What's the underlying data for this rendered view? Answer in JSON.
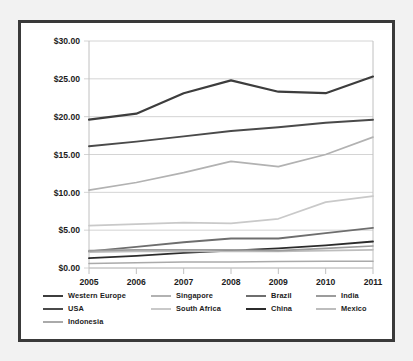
{
  "chart_data": {
    "type": "line",
    "title": "",
    "xlabel": "",
    "ylabel": "",
    "categories": [
      "2005",
      "2006",
      "2007",
      "2008",
      "2009",
      "2010",
      "2011"
    ],
    "x": [
      2005,
      2006,
      2007,
      2008,
      2009,
      2010,
      2011
    ],
    "ylim": [
      0,
      30
    ],
    "yticks": [
      0,
      5,
      10,
      15,
      20,
      25,
      30
    ],
    "ytick_labels": [
      "$0.00",
      "$5.00",
      "$10.00",
      "$15.00",
      "$20.00",
      "$25.00",
      "$30.00"
    ],
    "grid": true,
    "legend_position": "bottom",
    "series": [
      {
        "name": "Western Europe",
        "color": "#3d3d3d",
        "width": 2.2,
        "values": [
          19.6,
          20.4,
          23.1,
          24.8,
          23.3,
          23.1,
          25.3
        ]
      },
      {
        "name": "USA",
        "color": "#4a4a4a",
        "width": 1.9,
        "values": [
          16.1,
          16.7,
          17.4,
          18.1,
          18.6,
          19.2,
          19.6
        ]
      },
      {
        "name": "Singapore",
        "color": "#b2b2b2",
        "width": 1.7,
        "values": [
          10.3,
          11.3,
          12.6,
          14.1,
          13.4,
          15.0,
          17.3
        ]
      },
      {
        "name": "South Africa",
        "color": "#c9c9c9",
        "width": 1.7,
        "values": [
          5.6,
          5.8,
          6.0,
          5.9,
          6.5,
          8.7,
          9.5
        ]
      },
      {
        "name": "Brazil",
        "color": "#6e6e6e",
        "width": 1.8,
        "values": [
          2.2,
          2.8,
          3.4,
          3.9,
          3.9,
          4.6,
          5.3
        ]
      },
      {
        "name": "China",
        "color": "#2b2b2b",
        "width": 1.8,
        "values": [
          1.3,
          1.6,
          2.0,
          2.3,
          2.6,
          3.0,
          3.5
        ]
      },
      {
        "name": "India",
        "color": "#9c9c9c",
        "width": 1.6,
        "values": [
          2.3,
          2.4,
          2.4,
          2.4,
          2.3,
          2.6,
          2.9
        ]
      },
      {
        "name": "Mexico",
        "color": "#bdbdbd",
        "width": 1.6,
        "values": [
          2.1,
          2.2,
          2.2,
          2.2,
          2.2,
          2.3,
          2.4
        ]
      },
      {
        "name": "Indonesia",
        "color": "#aaaaaa",
        "width": 1.6,
        "values": [
          0.6,
          0.7,
          0.8,
          0.8,
          0.85,
          0.9,
          0.9
        ]
      }
    ]
  },
  "legend": {
    "rows": [
      [
        {
          "label": "Western Europe",
          "series": 0
        },
        {
          "label": "Singapore",
          "series": 2
        },
        {
          "label": "Brazil",
          "series": 4
        },
        {
          "label": "India",
          "series": 6
        }
      ],
      [
        {
          "label": "USA",
          "series": 1
        },
        {
          "label": "South Africa",
          "series": 3
        },
        {
          "label": "China",
          "series": 5
        },
        {
          "label": "Mexico",
          "series": 7
        }
      ],
      [
        {
          "label": "Indonesia",
          "series": 8
        }
      ]
    ]
  },
  "style": {
    "frame_color": "#3a3a3a",
    "grid_color": "#d4d4d4",
    "axis_color": "#c0c0c0",
    "page_background": "#f2f2f2",
    "plot_background": "#ffffff",
    "tick_label_color": "#1c1c1c"
  }
}
